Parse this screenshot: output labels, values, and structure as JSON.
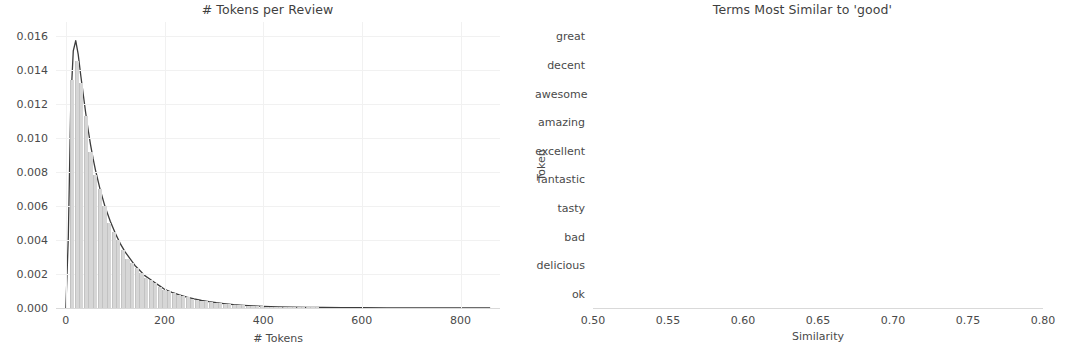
{
  "figure": {
    "width": 1070,
    "height": 348,
    "background": "#ffffff"
  },
  "chart_data": [
    {
      "type": "area",
      "id": "tokens-per-review",
      "title": "# Tokens per Review",
      "xlabel": "# Tokens",
      "ylabel": "",
      "xlim": [
        -20,
        880
      ],
      "ylim": [
        0.0,
        0.0168
      ],
      "grid": true,
      "xticks": [
        0,
        200,
        400,
        600,
        800
      ],
      "xticklabels": [
        "0",
        "200",
        "400",
        "600",
        "800"
      ],
      "yticks": [
        0.0,
        0.002,
        0.004,
        0.006,
        0.008,
        0.01,
        0.012,
        0.014,
        0.016
      ],
      "yticklabels": [
        "0.000",
        "0.002",
        "0.004",
        "0.006",
        "0.008",
        "0.010",
        "0.012",
        "0.014",
        "0.016"
      ],
      "hist_color": "#d6d6d6",
      "kde_color": "#3c3c3c",
      "note": "Right-skewed density of review token counts; peak ~0.0157 near 20 tokens, long tail out to ~880 tokens.",
      "x": [
        0,
        5,
        10,
        15,
        20,
        25,
        30,
        35,
        40,
        45,
        50,
        55,
        60,
        70,
        80,
        90,
        100,
        110,
        120,
        130,
        140,
        150,
        160,
        170,
        180,
        190,
        200,
        215,
        230,
        245,
        260,
        275,
        290,
        305,
        320,
        340,
        360,
        380,
        400,
        430,
        460,
        490,
        520,
        560,
        600,
        650,
        700,
        750,
        800,
        860
      ],
      "y": [
        0.0,
        0.0042,
        0.0121,
        0.0151,
        0.0157,
        0.0149,
        0.0137,
        0.0126,
        0.0115,
        0.0105,
        0.0096,
        0.0088,
        0.0081,
        0.0069,
        0.0059,
        0.0051,
        0.0044,
        0.0038,
        0.0033,
        0.0029,
        0.0025,
        0.0022,
        0.0019,
        0.0017,
        0.0015,
        0.0013,
        0.0011,
        0.00092,
        0.00077,
        0.00064,
        0.00053,
        0.00044,
        0.00037,
        0.00031,
        0.00026,
        0.0002,
        0.00016,
        0.00013,
        0.0001,
        7e-05,
        5e-05,
        4e-05,
        3e-05,
        2e-05,
        1.5e-05,
        1e-05,
        7e-06,
        5e-06,
        4e-06,
        2e-06
      ]
    },
    {
      "type": "bar",
      "orientation": "horizontal",
      "id": "terms-most-similar-to-good",
      "title": "Terms Most Similar to 'good'",
      "xlabel": "Similarity",
      "ylabel": "Token",
      "xlim": [
        0.5,
        0.8
      ],
      "grid": true,
      "xticks": [
        0.5,
        0.55,
        0.6,
        0.65,
        0.7,
        0.75,
        0.8
      ],
      "xticklabels": [
        "0.50",
        "0.55",
        "0.60",
        "0.65",
        "0.70",
        "0.75",
        "0.80"
      ],
      "bar_color": "#4f4f4f",
      "categories": [
        "great",
        "decent",
        "awesome",
        "amazing",
        "excellent",
        "fantastic",
        "tasty",
        "bad",
        "delicious",
        "ok"
      ],
      "values": [
        0.75,
        0.696,
        0.622,
        0.607,
        0.601,
        0.587,
        0.54,
        0.54,
        0.54,
        0.538
      ]
    }
  ]
}
